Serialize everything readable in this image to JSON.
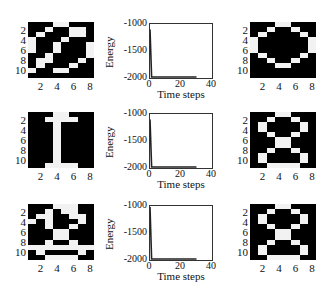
{
  "chart_data": [
    {
      "type": "heatmap",
      "title": "Noisy input pattern (row 1)",
      "position": "row1-left",
      "cols": 8,
      "rows": 11,
      "xticks": [
        "2",
        "4",
        "6",
        "8"
      ],
      "yticks": [
        "2",
        "4",
        "6",
        "8",
        "10"
      ],
      "grid": [
        [
          0,
          0,
          0,
          1,
          1,
          0,
          0,
          0
        ],
        [
          0,
          0,
          1,
          0,
          0,
          1,
          1,
          0
        ],
        [
          0,
          1,
          0,
          0,
          0,
          1,
          1,
          0
        ],
        [
          1,
          0,
          0,
          0,
          1,
          0,
          0,
          0
        ],
        [
          1,
          0,
          0,
          1,
          0,
          0,
          0,
          1
        ],
        [
          1,
          0,
          0,
          1,
          0,
          0,
          0,
          1
        ],
        [
          0,
          0,
          1,
          0,
          0,
          0,
          0,
          1
        ],
        [
          0,
          1,
          1,
          0,
          0,
          0,
          1,
          0
        ],
        [
          0,
          1,
          0,
          0,
          0,
          1,
          0,
          0
        ],
        [
          1,
          0,
          0,
          1,
          1,
          0,
          0,
          0
        ],
        [
          0,
          0,
          0,
          0,
          0,
          0,
          0,
          0
        ]
      ]
    },
    {
      "type": "line",
      "position": "row1-middle",
      "xlabel": "Time steps",
      "ylabel": "Energy",
      "xticks": [
        "0",
        "20",
        "40"
      ],
      "yticks": [
        "-1000",
        "-1500",
        "-2000"
      ],
      "xlim": [
        0,
        40
      ],
      "ylim": [
        -2000,
        -1000
      ],
      "x": [
        0,
        1,
        2,
        10,
        20,
        30
      ],
      "values": [
        -1100,
        -1990,
        -2000,
        -2000,
        -2000,
        -2000
      ]
    },
    {
      "type": "heatmap",
      "title": "Recalled pattern (row 1) - digit 0",
      "position": "row1-right",
      "cols": 8,
      "rows": 11,
      "xticks": [
        "2",
        "4",
        "6",
        "8"
      ],
      "yticks": [
        "2",
        "4",
        "6",
        "8",
        "10"
      ],
      "grid": [
        [
          0,
          0,
          0,
          1,
          1,
          0,
          0,
          0
        ],
        [
          0,
          0,
          1,
          0,
          0,
          1,
          0,
          0
        ],
        [
          0,
          1,
          0,
          0,
          0,
          0,
          1,
          0
        ],
        [
          1,
          0,
          0,
          0,
          0,
          0,
          0,
          1
        ],
        [
          1,
          0,
          0,
          0,
          0,
          0,
          0,
          1
        ],
        [
          1,
          0,
          0,
          0,
          0,
          0,
          0,
          1
        ],
        [
          0,
          1,
          0,
          0,
          0,
          0,
          1,
          0
        ],
        [
          0,
          0,
          1,
          0,
          0,
          1,
          0,
          0
        ],
        [
          0,
          0,
          0,
          1,
          1,
          0,
          0,
          0
        ],
        [
          0,
          0,
          0,
          0,
          0,
          0,
          0,
          0
        ],
        [
          0,
          0,
          0,
          0,
          0,
          0,
          0,
          0
        ]
      ]
    },
    {
      "type": "heatmap",
      "title": "Input pattern (row 2) - digit 1",
      "position": "row2-left",
      "cols": 8,
      "rows": 11,
      "xticks": [
        "2",
        "4",
        "6",
        "8"
      ],
      "yticks": [
        "2",
        "4",
        "6",
        "8",
        "10"
      ],
      "grid": [
        [
          0,
          0,
          0,
          1,
          1,
          0,
          0,
          0
        ],
        [
          0,
          0,
          1,
          1,
          1,
          1,
          0,
          0
        ],
        [
          0,
          0,
          0,
          1,
          0,
          0,
          0,
          0
        ],
        [
          0,
          0,
          0,
          1,
          0,
          0,
          0,
          0
        ],
        [
          0,
          0,
          0,
          1,
          0,
          0,
          0,
          0
        ],
        [
          0,
          0,
          0,
          1,
          0,
          0,
          0,
          0
        ],
        [
          0,
          0,
          0,
          1,
          0,
          0,
          0,
          0
        ],
        [
          0,
          0,
          0,
          1,
          0,
          0,
          0,
          0
        ],
        [
          0,
          0,
          0,
          1,
          0,
          0,
          0,
          0
        ],
        [
          0,
          0,
          0,
          1,
          0,
          0,
          0,
          0
        ],
        [
          0,
          0,
          1,
          1,
          1,
          1,
          0,
          0
        ]
      ]
    },
    {
      "type": "line",
      "position": "row2-middle",
      "xlabel": "Time steps",
      "ylabel": "Energy",
      "xticks": [
        "0",
        "20",
        "40"
      ],
      "yticks": [
        "-1000",
        "-1500",
        "-2000"
      ],
      "xlim": [
        0,
        40
      ],
      "ylim": [
        -2000,
        -1000
      ],
      "x": [
        0,
        1,
        2,
        10,
        20,
        30
      ],
      "values": [
        -1100,
        -1980,
        -1990,
        -1990,
        -1990,
        -1990
      ]
    },
    {
      "type": "heatmap",
      "title": "Recalled pattern (row 2) - digit 8",
      "position": "row2-right",
      "cols": 8,
      "rows": 11,
      "xticks": [
        "2",
        "4",
        "6",
        "8"
      ],
      "yticks": [
        "2",
        "4",
        "6",
        "8",
        "10"
      ],
      "grid": [
        [
          0,
          0,
          0,
          1,
          1,
          0,
          0,
          0
        ],
        [
          0,
          0,
          1,
          0,
          0,
          1,
          0,
          0
        ],
        [
          0,
          1,
          0,
          0,
          0,
          0,
          1,
          0
        ],
        [
          0,
          1,
          0,
          0,
          0,
          0,
          1,
          0
        ],
        [
          0,
          0,
          1,
          0,
          0,
          1,
          0,
          0
        ],
        [
          0,
          0,
          0,
          1,
          1,
          0,
          0,
          0
        ],
        [
          0,
          0,
          0,
          1,
          1,
          0,
          0,
          0
        ],
        [
          0,
          0,
          1,
          0,
          0,
          1,
          0,
          0
        ],
        [
          0,
          1,
          0,
          0,
          0,
          0,
          1,
          0
        ],
        [
          0,
          1,
          0,
          0,
          0,
          0,
          1,
          0
        ],
        [
          0,
          0,
          1,
          1,
          1,
          1,
          0,
          0
        ]
      ]
    },
    {
      "type": "heatmap",
      "title": "Noisy input pattern (row 3)",
      "position": "row3-left",
      "cols": 8,
      "rows": 11,
      "xticks": [
        "2",
        "4",
        "6",
        "8"
      ],
      "yticks": [
        "2",
        "4",
        "6",
        "8",
        "10"
      ],
      "grid": [
        [
          0,
          0,
          0,
          1,
          1,
          1,
          0,
          0
        ],
        [
          0,
          0,
          1,
          0,
          1,
          1,
          0,
          0
        ],
        [
          0,
          1,
          1,
          0,
          0,
          1,
          1,
          0
        ],
        [
          1,
          0,
          1,
          0,
          0,
          0,
          1,
          0
        ],
        [
          0,
          0,
          1,
          0,
          0,
          1,
          0,
          0
        ],
        [
          0,
          0,
          0,
          1,
          1,
          0,
          0,
          0
        ],
        [
          0,
          0,
          0,
          1,
          1,
          0,
          0,
          0
        ],
        [
          0,
          0,
          1,
          0,
          0,
          1,
          0,
          0
        ],
        [
          1,
          1,
          1,
          1,
          1,
          1,
          1,
          1
        ],
        [
          0,
          1,
          0,
          0,
          0,
          0,
          1,
          0
        ],
        [
          0,
          0,
          1,
          1,
          1,
          1,
          0,
          0
        ]
      ]
    },
    {
      "type": "line",
      "position": "row3-middle",
      "xlabel": "Time steps",
      "ylabel": "Energy",
      "xticks": [
        "0",
        "20",
        "40"
      ],
      "yticks": [
        "-1000",
        "-1500",
        "-2000"
      ],
      "xlim": [
        0,
        40
      ],
      "ylim": [
        -2000,
        -1000
      ],
      "x": [
        0,
        1,
        2,
        10,
        20,
        30
      ],
      "values": [
        -1020,
        -1980,
        -1990,
        -1990,
        -1990,
        -1990
      ]
    },
    {
      "type": "heatmap",
      "title": "Recalled pattern (row 3) - digit 8",
      "position": "row3-right",
      "cols": 8,
      "rows": 11,
      "xticks": [
        "2",
        "4",
        "6",
        "8"
      ],
      "yticks": [
        "2",
        "4",
        "6",
        "8",
        "10"
      ],
      "grid": [
        [
          0,
          0,
          0,
          1,
          1,
          0,
          0,
          0
        ],
        [
          0,
          0,
          1,
          0,
          0,
          1,
          0,
          0
        ],
        [
          0,
          1,
          0,
          0,
          0,
          0,
          1,
          0
        ],
        [
          0,
          1,
          0,
          0,
          0,
          0,
          1,
          0
        ],
        [
          0,
          0,
          1,
          0,
          0,
          1,
          0,
          0
        ],
        [
          0,
          0,
          0,
          1,
          1,
          0,
          0,
          0
        ],
        [
          0,
          0,
          0,
          1,
          1,
          0,
          0,
          0
        ],
        [
          0,
          0,
          1,
          0,
          0,
          1,
          0,
          0
        ],
        [
          0,
          1,
          0,
          0,
          0,
          0,
          1,
          0
        ],
        [
          0,
          1,
          0,
          0,
          0,
          0,
          1,
          0
        ],
        [
          0,
          0,
          1,
          1,
          1,
          1,
          0,
          0
        ]
      ]
    }
  ],
  "layout": {
    "rows_top": [
      22,
      110,
      203
    ],
    "grid_left": [
      28,
      28,
      250
    ],
    "plot_left": 149
  }
}
